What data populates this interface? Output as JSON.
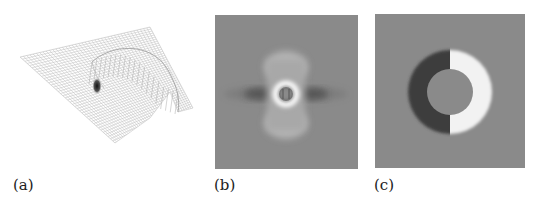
{
  "figure": {
    "panels": [
      {
        "id": "a",
        "label": "(a)",
        "description": "3D wireframe surface plot with curved ridge and dark spike"
      },
      {
        "id": "b",
        "label": "(b)",
        "description": "Grayscale field: bright central ring with vertical lobes and dark horizontal lobes"
      },
      {
        "id": "c",
        "label": "(c)",
        "description": "Grayscale field: crescent pair, dark on left and bright on right, around a gray disc"
      }
    ],
    "colors": {
      "background_gray": "#8a8a8a",
      "mesh_line": "#b8b8b8",
      "dark_region": "#3c3c3c",
      "bright_region": "#f2f2f2",
      "label_text": "#222222"
    }
  }
}
